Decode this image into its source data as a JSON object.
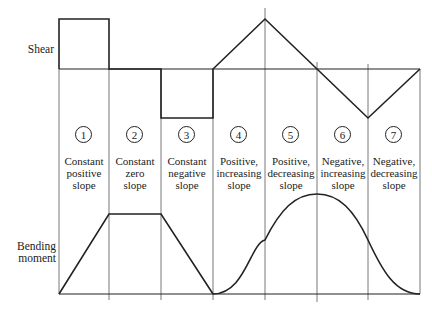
{
  "labels": {
    "shear": "Shear",
    "bending_moment_line1": "Bending",
    "bending_moment_line2": "moment"
  },
  "regions": [
    {
      "number": "1",
      "line1": "Constant",
      "line2": "positive",
      "line3": "slope"
    },
    {
      "number": "2",
      "line1": "Constant",
      "line2": "zero",
      "line3": "slope"
    },
    {
      "number": "3",
      "line1": "Constant",
      "line2": "negative",
      "line3": "slope"
    },
    {
      "number": "4",
      "line1": "Positive,",
      "line2": "increasing",
      "line3": "slope"
    },
    {
      "number": "5",
      "line1": "Positive,",
      "line2": "decreasing",
      "line3": "slope"
    },
    {
      "number": "6",
      "line1": "Negative,",
      "line2": "increasing",
      "line3": "slope"
    },
    {
      "number": "7",
      "line1": "Negative,",
      "line2": "decreasing",
      "line3": "slope"
    }
  ],
  "colors": {
    "line": "#222222",
    "background": "#ffffff"
  }
}
